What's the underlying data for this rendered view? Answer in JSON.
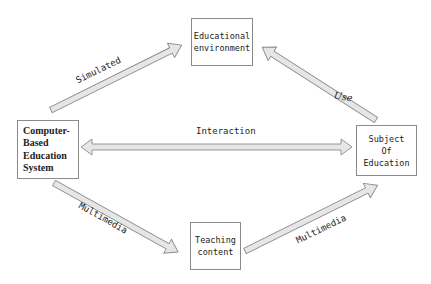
{
  "diagram": {
    "type": "flow",
    "nodes": [
      {
        "id": "env",
        "label": "Educational\nenvironment"
      },
      {
        "id": "cbes",
        "label": "Computer-\nBased\nEducation\nSystem"
      },
      {
        "id": "subject",
        "label": "Subject\nOf\nEducation"
      },
      {
        "id": "teaching",
        "label": "Teaching\ncontent"
      }
    ],
    "edges": [
      {
        "from": "cbes",
        "to": "env",
        "label": "Simulated",
        "direction": "forward"
      },
      {
        "from": "subject",
        "to": "env",
        "label": "Use",
        "direction": "forward"
      },
      {
        "from": "cbes",
        "to": "subject",
        "label": "Interaction",
        "direction": "bidirectional"
      },
      {
        "from": "cbes",
        "to": "teaching",
        "label": "Multimedia",
        "direction": "forward"
      },
      {
        "from": "teaching",
        "to": "subject",
        "label": "Multimedia",
        "direction": "forward"
      }
    ],
    "colors": {
      "arrow_fill": "#e6e6e6",
      "arrow_stroke": "#8c8c8c",
      "box_border": "#8a8a8a",
      "text": "#222222"
    }
  }
}
